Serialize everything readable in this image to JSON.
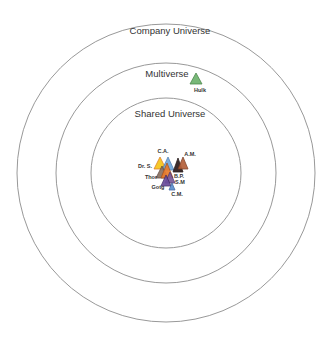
{
  "diagram": {
    "center": {
      "x": 166,
      "y": 173
    },
    "rings": [
      {
        "name": "Company Universe",
        "radius": 149,
        "label_x": 170,
        "label_y": 34
      },
      {
        "name": "Multiverse",
        "radius": 110,
        "label_x": 167,
        "label_y": 77
      },
      {
        "name": "Shared Universe",
        "radius": 75,
        "label_x": 170,
        "label_y": 117
      }
    ],
    "ring_color": "#999999",
    "characters": [
      {
        "label": "Hulk",
        "color": "#6db36d",
        "stroke": "#3f7f3f",
        "apex": [
          196,
          73
        ],
        "base_y": 84,
        "half_w": 6,
        "label_x": 200,
        "label_y": 92
      },
      {
        "label": "Dr. S.",
        "color": "#f5c518",
        "stroke": "#d9771c",
        "apex": [
          160,
          157
        ],
        "base_y": 169,
        "half_w": 6,
        "label_x": 145,
        "label_y": 168
      },
      {
        "label": "C.A.",
        "color": "#6fa8dc",
        "stroke": "#4a78b0",
        "apex": [
          168,
          157
        ],
        "base_y": 170,
        "half_w": 6,
        "label_x": 163,
        "label_y": 153
      },
      {
        "label": "",
        "color": "#2b1a1a",
        "stroke": "#1a0f0f",
        "apex": [
          178,
          158
        ],
        "base_y": 172,
        "half_w": 5,
        "label_x": 0,
        "label_y": 0
      },
      {
        "label": "A.M.",
        "color": "#b5603a",
        "stroke": "#7a3a20",
        "apex": [
          183,
          157
        ],
        "base_y": 169,
        "half_w": 5,
        "label_x": 190,
        "label_y": 156
      },
      {
        "label": "Thor",
        "color": "#8a7060",
        "stroke": "#5a4438",
        "apex": [
          162,
          166
        ],
        "base_y": 178,
        "half_w": 6,
        "label_x": 151,
        "label_y": 179
      },
      {
        "label": "B.P.",
        "color": "#e87a2a",
        "stroke": "#a8501a",
        "apex": [
          167,
          163
        ],
        "base_y": 178,
        "half_w": 6,
        "label_x": 179,
        "label_y": 178
      },
      {
        "label": "S.M",
        "color": "#7a5a9a",
        "stroke": "#4c3670",
        "apex": [
          170,
          172
        ],
        "base_y": 183,
        "half_w": 5,
        "label_x": 180,
        "label_y": 184
      },
      {
        "label": "Gotg",
        "color": "#6a4c9c",
        "stroke": "#3f2a66",
        "apex": [
          166,
          175
        ],
        "base_y": 186,
        "half_w": 5,
        "label_x": 158,
        "label_y": 189
      },
      {
        "label": "C.M.",
        "color": "#5b8fd0",
        "stroke": "#3a62a0",
        "apex": [
          172,
          183
        ],
        "base_y": 190,
        "half_w": 3,
        "label_x": 177,
        "label_y": 196
      }
    ]
  }
}
